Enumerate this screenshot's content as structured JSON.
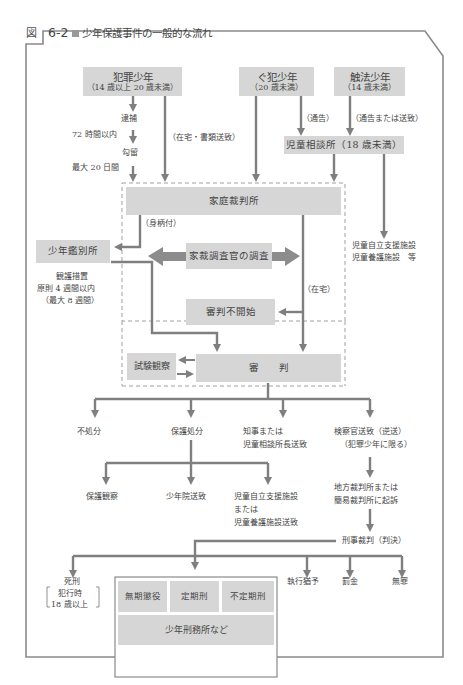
{
  "figure": {
    "label": "図",
    "number": "6-2",
    "title": "少年保護事件の一般的な流れ"
  },
  "colors": {
    "box_fill": "#d6d6d6",
    "arrow": "#7f7f7f",
    "frame": "#8a8a8a",
    "dashed": "#9a9a9a",
    "text": "#444444"
  },
  "sources": {
    "hanzai": {
      "label": "犯罪少年",
      "age": "（14 歳以上 20 歳未満）"
    },
    "guhan": {
      "label": "ぐ犯少年",
      "age": "（20 歳未満）"
    },
    "shokuho": {
      "label": "触法少年",
      "age": "（14 歳未満）"
    }
  },
  "flow_labels": {
    "taiho": "逮捕",
    "h72": "72 時間以内",
    "koryu": "勾留",
    "max20": "最大 20 日間",
    "zaitaku_shorui": "（在宅・書類送致）",
    "tsukoku": "（通告）",
    "tsukoku_soichi": "（通告または送致）",
    "migaratsuki": "（身柄付）",
    "zaitaku": "（在宅）"
  },
  "nodes": {
    "jidosodanjo": "児童相談所（18 歳未満）",
    "jido_shisetsu_line1": "児童自立支援施設",
    "jido_shisetsu_line2": "児童養護施設　等",
    "katei_saibansho": "家庭裁判所",
    "kanbetsusho": "少年鑑別所",
    "kango_line1": "観護措置",
    "kango_line2": "原則 4 週間以内",
    "kango_line3": "（最大 8 週間）",
    "chosakan": "家裁調査官の調査",
    "shinpan_fukaishi": "審判不開始",
    "shiken_kansatsu": "試験観察",
    "shinpan": "審　　判"
  },
  "outcomes": {
    "fushobun": "不処分",
    "hogo_shobun": "保護処分",
    "chiji_line1": "知事または",
    "chiji_line2": "児童相談所長送致",
    "kensatsu_line1": "検察官送致（逆送）",
    "kensatsu_line2": "（犯罪少年に限る）"
  },
  "hogo": {
    "hogo_kansatsu": "保護観察",
    "shonenin": "少年院送致",
    "shisetsu_line1": "児童自立支援施設",
    "shisetsu_line2": "または",
    "shisetsu_line3": "児童養護施設送致"
  },
  "criminal": {
    "kiso_line1": "地方裁判所または",
    "kiso_line2": "簡易裁判所に起訴",
    "keiji_saiban": "刑事裁判（判決）",
    "shikei": "死刑",
    "shikei_cond_line1": "犯行時",
    "shikei_cond_line2": "18 歳以上",
    "muki": "無期懲役",
    "teiki": "定期刑",
    "futeiki": "不定期刑",
    "keimusho": "少年刑務所など",
    "shikko_yuyo": "執行猶予",
    "bakkin": "罰金",
    "muzai": "無罪"
  }
}
